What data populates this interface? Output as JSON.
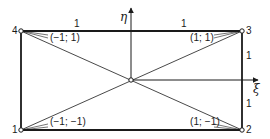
{
  "figure": {
    "type": "isoparametric reference quadrilateral",
    "colors": {
      "stroke": "#1a1a1a",
      "background": "#ffffff"
    },
    "axes": {
      "horizontal": {
        "label": "ξ",
        "direction": "right"
      },
      "vertical": {
        "label": "η",
        "direction": "up"
      }
    },
    "nodes": [
      {
        "number": "1",
        "coords": "(−1; −1)",
        "position": "bottom-left"
      },
      {
        "number": "2",
        "coords": "(1; −1)",
        "position": "bottom-right"
      },
      {
        "number": "3",
        "coords": "(1; 1)",
        "position": "top-right"
      },
      {
        "number": "4",
        "coords": "(−1; 1)",
        "position": "top-left"
      }
    ],
    "center_node": {
      "position": "origin"
    },
    "edge_lengths": {
      "top_left_half": "1",
      "top_right_half": "1",
      "right_upper_half": "1",
      "right_lower_half": "1"
    },
    "diagonals": [
      "1-3",
      "2-4"
    ]
  }
}
